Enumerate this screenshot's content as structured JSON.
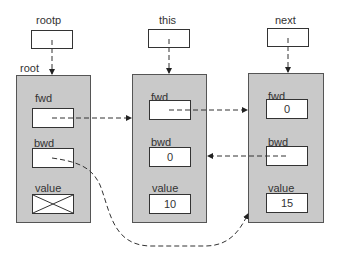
{
  "pointers": [
    {
      "label": "rootp"
    },
    {
      "label": "this"
    },
    {
      "label": "next"
    }
  ],
  "nodes": [
    {
      "name": "root",
      "fields": [
        {
          "label": "fwd",
          "value": ""
        },
        {
          "label": "bwd",
          "value": ""
        },
        {
          "label": "value",
          "value": "",
          "crossed": true
        }
      ]
    },
    {
      "name": "",
      "fields": [
        {
          "label": "fwd",
          "value": ""
        },
        {
          "label": "bwd",
          "value": "0"
        },
        {
          "label": "value",
          "value": "10"
        }
      ]
    },
    {
      "name": "",
      "fields": [
        {
          "label": "fwd",
          "value": "0"
        },
        {
          "label": "bwd",
          "value": ""
        },
        {
          "label": "value",
          "value": "15"
        }
      ]
    }
  ],
  "colors": {
    "node_fill": "#c9c9c9",
    "line": "#333333"
  }
}
